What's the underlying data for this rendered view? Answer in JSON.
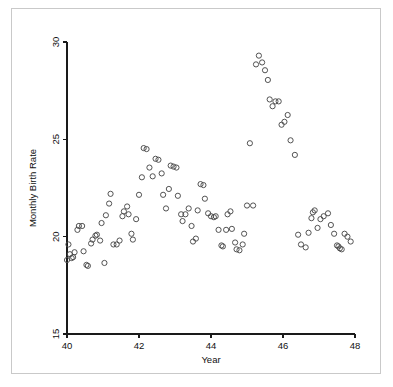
{
  "figure": {
    "border_color": "#c9c9c9",
    "background": "#ffffff"
  },
  "chart_data": {
    "type": "scatter",
    "title": "",
    "xlabel": "Year",
    "ylabel": "Monthly Birth Rate",
    "xlim": [
      40,
      48
    ],
    "ylim": [
      15,
      30
    ],
    "xticks": [
      40,
      42,
      44,
      46,
      48
    ],
    "xtick_labels": [
      "40",
      "42",
      "44",
      "46",
      "48"
    ],
    "yticks": [
      15,
      20,
      25,
      30
    ],
    "ytick_labels": [
      "15",
      "20",
      "25",
      "30"
    ],
    "grid": false,
    "legend": null,
    "marker": "open-circle",
    "marker_color": "#4a4a4a",
    "marker_size": 2.6,
    "series": [
      {
        "name": "Monthly Birth Rate",
        "x": [
          40.0,
          40.04,
          40.08,
          40.13,
          40.17,
          40.21,
          40.29,
          40.33,
          40.42,
          40.46,
          40.54,
          40.58,
          40.67,
          40.71,
          40.79,
          40.83,
          40.92,
          40.96,
          41.04,
          41.08,
          41.17,
          41.21,
          41.29,
          41.38,
          41.46,
          41.54,
          41.58,
          41.67,
          41.71,
          41.79,
          41.83,
          41.92,
          42.0,
          42.08,
          42.13,
          42.21,
          42.29,
          42.38,
          42.46,
          42.54,
          42.63,
          42.67,
          42.75,
          42.83,
          42.88,
          42.96,
          43.04,
          43.08,
          43.17,
          43.21,
          43.29,
          43.38,
          43.46,
          43.5,
          43.58,
          43.63,
          43.71,
          43.79,
          43.83,
          43.92,
          44.0,
          44.08,
          44.13,
          44.21,
          44.29,
          44.33,
          44.42,
          44.46,
          44.54,
          44.58,
          44.67,
          44.71,
          44.79,
          44.88,
          44.92,
          45.0,
          45.08,
          45.17,
          45.25,
          45.33,
          45.42,
          45.5,
          45.58,
          45.63,
          45.71,
          45.79,
          45.88,
          45.96,
          46.04,
          46.13,
          46.21,
          46.33,
          46.42,
          46.5,
          46.63,
          46.71,
          46.79,
          46.83,
          46.88,
          46.96,
          47.04,
          47.13,
          47.25,
          47.33,
          47.42,
          47.5,
          47.54,
          47.58,
          47.63,
          47.71,
          47.79,
          47.88
        ],
        "y": [
          18.8,
          19.6,
          19.1,
          18.9,
          18.95,
          19.2,
          20.35,
          20.55,
          20.55,
          19.25,
          18.55,
          18.5,
          19.65,
          19.85,
          20.05,
          20.1,
          19.8,
          20.7,
          18.65,
          21.1,
          21.7,
          22.2,
          19.6,
          19.6,
          19.8,
          21.05,
          21.3,
          21.55,
          21.15,
          20.15,
          19.85,
          20.9,
          22.15,
          23.05,
          24.55,
          24.5,
          23.55,
          23.1,
          24.0,
          23.95,
          23.25,
          22.15,
          21.45,
          22.45,
          23.65,
          23.6,
          23.55,
          22.1,
          21.15,
          20.8,
          21.15,
          21.45,
          20.55,
          19.75,
          19.9,
          21.35,
          22.7,
          22.65,
          21.95,
          21.2,
          21.05,
          21.0,
          21.05,
          20.35,
          19.55,
          19.5,
          20.35,
          21.15,
          21.3,
          20.4,
          19.7,
          19.35,
          19.3,
          19.6,
          20.15,
          21.6,
          24.8,
          21.6,
          28.85,
          29.3,
          28.95,
          28.55,
          28.05,
          27.05,
          26.7,
          26.95,
          26.95,
          25.75,
          25.9,
          26.25,
          24.95,
          24.2,
          20.1,
          19.6,
          19.45,
          20.2,
          20.95,
          21.25,
          21.35,
          20.45,
          20.9,
          21.05,
          21.2,
          20.6,
          20.15,
          19.55,
          19.5,
          19.4,
          19.35,
          20.15,
          20.0,
          19.75
        ]
      }
    ]
  }
}
